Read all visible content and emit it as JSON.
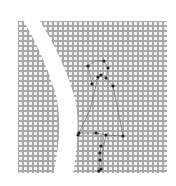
{
  "image": {
    "description": "Grey dotted grid square with a white crescent band on the left and a stick-figure pose skeleton of keypoints",
    "background": "#ffffff",
    "panel": {
      "x": 18,
      "y": 21,
      "w": 149,
      "h": 152,
      "color": "#a9a9a9",
      "dot_color": "#f4f4f4",
      "pitch": 5
    },
    "skeleton": {
      "line_color": "#555555",
      "point_color": "#222222",
      "points": [
        [
          88,
          66
        ],
        [
          104,
          61
        ],
        [
          108,
          68
        ],
        [
          98,
          77
        ],
        [
          101,
          75
        ],
        [
          92,
          84
        ],
        [
          106,
          78
        ],
        [
          113,
          86
        ],
        [
          79,
          133
        ],
        [
          78,
          135
        ],
        [
          96,
          133
        ],
        [
          106,
          135
        ],
        [
          123,
          136
        ],
        [
          101,
          146
        ],
        [
          100,
          153
        ],
        [
          100,
          160
        ],
        [
          99,
          171
        ],
        [
          101,
          169
        ]
      ]
    }
  }
}
